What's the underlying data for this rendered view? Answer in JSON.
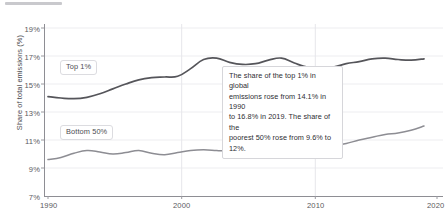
{
  "chart_data": {
    "type": "line",
    "title": "",
    "subtitle": "",
    "xlabel": "",
    "ylabel": "Share of total emissions (%)",
    "xlim": [
      1990,
      2020
    ],
    "ylim": [
      7,
      19
    ],
    "y_ticks": [
      "7%",
      "9%",
      "11%",
      "13%",
      "15%",
      "17%",
      "19%"
    ],
    "y_tick_values": [
      7,
      9,
      11,
      13,
      15,
      17,
      19
    ],
    "x_ticks": [
      "1990",
      "2000",
      "2010",
      "2020"
    ],
    "x_tick_values": [
      1990,
      2000,
      2010,
      2020
    ],
    "grid": "vertical gridlines at 2000 and 2010; faint horizontal gridlines at each y tick",
    "legend_position": "inline labels on plot",
    "x": [
      1990,
      1991,
      1992,
      1993,
      1994,
      1995,
      1996,
      1997,
      1998,
      1999,
      2000,
      2001,
      2002,
      2003,
      2004,
      2005,
      2006,
      2007,
      2008,
      2009,
      2010,
      2011,
      2012,
      2013,
      2014,
      2015,
      2016,
      2017,
      2018,
      2019
    ],
    "series": [
      {
        "name": "Top 1%",
        "color": "#55555a",
        "label": "Top 1%",
        "values": [
          14.1,
          14.0,
          13.95,
          14.05,
          14.3,
          14.65,
          15.0,
          15.3,
          15.45,
          15.5,
          15.55,
          16.1,
          16.75,
          16.85,
          16.55,
          16.4,
          16.45,
          16.7,
          16.85,
          16.5,
          16.2,
          16.1,
          16.2,
          16.45,
          16.6,
          16.8,
          16.85,
          16.75,
          16.7,
          16.8
        ]
      },
      {
        "name": "Bottom 50%",
        "color": "#8d8d93",
        "label": "Bottom 50%",
        "values": [
          9.6,
          9.75,
          10.05,
          10.25,
          10.15,
          10.0,
          10.1,
          10.25,
          10.05,
          9.95,
          10.1,
          10.25,
          10.3,
          10.25,
          10.2,
          10.25,
          10.35,
          10.4,
          10.45,
          10.75,
          10.6,
          10.55,
          10.6,
          10.75,
          11.0,
          11.2,
          11.4,
          11.5,
          11.7,
          12.0
        ]
      }
    ],
    "annotation": {
      "line1": "The share of the top 1% in global",
      "line2": "emissions rose from 14.1% in 1990",
      "line3": "to 16.8% in 2019. The share of the",
      "line4": "poorest 50% rose from 9.6% to 12%."
    }
  }
}
